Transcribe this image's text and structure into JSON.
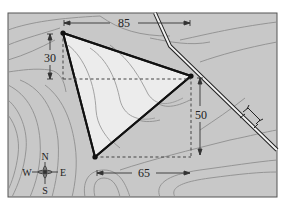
{
  "diagram": {
    "type": "topographic-map-triangle",
    "colors": {
      "map_fill": "#c8c8c8",
      "triangle_fill": "#ececec",
      "contour": "#8e8e8e",
      "outline": "#111111",
      "dashed": "#444444",
      "frame": "#555555"
    },
    "dimensions": {
      "top": "85",
      "left": "30",
      "right": "50",
      "bottom": "65"
    },
    "compass": {
      "north": "N",
      "south": "S",
      "east": "E",
      "west": "W"
    },
    "vertices": [
      {
        "id": "A",
        "x": 63,
        "y": 33
      },
      {
        "id": "B",
        "x": 191,
        "y": 76
      },
      {
        "id": "C",
        "x": 95,
        "y": 157
      }
    ]
  }
}
